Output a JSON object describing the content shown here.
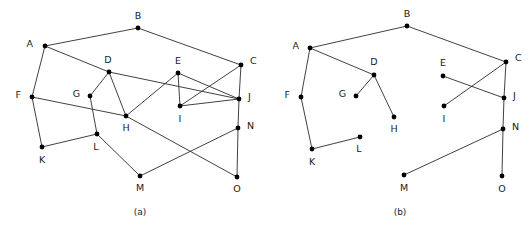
{
  "figure": {
    "background_color": "#ffffff",
    "edge_color": "#2b2b2b",
    "vertex_color": "#000000",
    "label_color": "#1a1a1a",
    "width": 531,
    "height": 235
  },
  "panels": [
    {
      "id": "panel-a",
      "caption": "(a)",
      "caption_pos": {
        "x": 140,
        "y": 215
      },
      "type": "graph",
      "vertices": [
        {
          "id": "A",
          "label": "A",
          "x": 45,
          "y": 46,
          "lx": 33,
          "ly": 44
        },
        {
          "id": "B",
          "label": "B",
          "x": 138,
          "y": 28,
          "lx": 138,
          "ly": 16
        },
        {
          "id": "C",
          "label": "C",
          "x": 241,
          "y": 65,
          "lx": 250,
          "ly": 61
        },
        {
          "id": "D",
          "label": "D",
          "x": 109,
          "y": 72,
          "lx": 108,
          "ly": 60
        },
        {
          "id": "E",
          "label": "E",
          "x": 178,
          "y": 73,
          "lx": 178,
          "ly": 61
        },
        {
          "id": "F",
          "label": "F",
          "x": 32,
          "y": 97,
          "lx": 21,
          "ly": 95
        },
        {
          "id": "G",
          "label": "G",
          "x": 90,
          "y": 96,
          "lx": 80,
          "ly": 94
        },
        {
          "id": "H",
          "label": "H",
          "x": 126,
          "y": 116,
          "lx": 126,
          "ly": 128
        },
        {
          "id": "I",
          "label": "I",
          "x": 180,
          "y": 106,
          "lx": 180,
          "ly": 119
        },
        {
          "id": "J",
          "label": "J",
          "x": 239,
          "y": 99,
          "lx": 248,
          "ly": 97
        },
        {
          "id": "K",
          "label": "K",
          "x": 42,
          "y": 147,
          "lx": 42,
          "ly": 160
        },
        {
          "id": "L",
          "label": "L",
          "x": 97,
          "y": 134,
          "lx": 96,
          "ly": 147
        },
        {
          "id": "M",
          "label": "M",
          "x": 140,
          "y": 176,
          "lx": 140,
          "ly": 188
        },
        {
          "id": "N",
          "label": "N",
          "x": 238,
          "y": 128,
          "lx": 247,
          "ly": 126
        },
        {
          "id": "O",
          "label": "O",
          "x": 237,
          "y": 177,
          "lx": 237,
          "ly": 189
        }
      ],
      "edges": [
        [
          "A",
          "B"
        ],
        [
          "B",
          "C"
        ],
        [
          "A",
          "D"
        ],
        [
          "A",
          "F"
        ],
        [
          "D",
          "G"
        ],
        [
          "D",
          "H"
        ],
        [
          "D",
          "J"
        ],
        [
          "G",
          "L"
        ],
        [
          "F",
          "H"
        ],
        [
          "F",
          "K"
        ],
        [
          "K",
          "L"
        ],
        [
          "L",
          "M"
        ],
        [
          "H",
          "E"
        ],
        [
          "H",
          "O"
        ],
        [
          "E",
          "I"
        ],
        [
          "E",
          "J"
        ],
        [
          "C",
          "I"
        ],
        [
          "C",
          "J"
        ],
        [
          "I",
          "J"
        ],
        [
          "J",
          "N"
        ],
        [
          "N",
          "O"
        ],
        [
          "M",
          "N"
        ]
      ]
    },
    {
      "id": "panel-b",
      "caption": "(b)",
      "caption_pos": {
        "x": 400,
        "y": 215
      },
      "type": "spanning-tree",
      "vertices": [
        {
          "id": "A",
          "label": "A",
          "x": 310,
          "y": 48,
          "lx": 299,
          "ly": 46
        },
        {
          "id": "B",
          "label": "B",
          "x": 407,
          "y": 26,
          "lx": 407,
          "ly": 14
        },
        {
          "id": "C",
          "label": "C",
          "x": 506,
          "y": 62,
          "lx": 515,
          "ly": 58
        },
        {
          "id": "D",
          "label": "D",
          "x": 374,
          "y": 75,
          "lx": 374,
          "ly": 62
        },
        {
          "id": "E",
          "label": "E",
          "x": 443,
          "y": 76,
          "lx": 443,
          "ly": 63
        },
        {
          "id": "F",
          "label": "F",
          "x": 301,
          "y": 97,
          "lx": 290,
          "ly": 95
        },
        {
          "id": "G",
          "label": "G",
          "x": 356,
          "y": 96,
          "lx": 346,
          "ly": 94
        },
        {
          "id": "H",
          "label": "H",
          "x": 394,
          "y": 117,
          "lx": 394,
          "ly": 129
        },
        {
          "id": "I",
          "label": "I",
          "x": 444,
          "y": 106,
          "lx": 444,
          "ly": 119
        },
        {
          "id": "J",
          "label": "J",
          "x": 504,
          "y": 98,
          "lx": 513,
          "ly": 96
        },
        {
          "id": "K",
          "label": "K",
          "x": 312,
          "y": 149,
          "lx": 312,
          "ly": 162
        },
        {
          "id": "L",
          "label": "L",
          "x": 360,
          "y": 137,
          "lx": 359,
          "ly": 149
        },
        {
          "id": "M",
          "label": "M",
          "x": 404,
          "y": 175,
          "lx": 404,
          "ly": 188
        },
        {
          "id": "N",
          "label": "N",
          "x": 503,
          "y": 129,
          "lx": 512,
          "ly": 127
        },
        {
          "id": "O",
          "label": "O",
          "x": 502,
          "y": 176,
          "lx": 502,
          "ly": 189
        }
      ],
      "edges": [
        [
          "A",
          "B"
        ],
        [
          "B",
          "C"
        ],
        [
          "A",
          "D"
        ],
        [
          "A",
          "F"
        ],
        [
          "D",
          "G"
        ],
        [
          "D",
          "H"
        ],
        [
          "F",
          "K"
        ],
        [
          "K",
          "L"
        ],
        [
          "C",
          "I"
        ],
        [
          "C",
          "J"
        ],
        [
          "E",
          "J"
        ],
        [
          "J",
          "N"
        ],
        [
          "N",
          "O"
        ],
        [
          "M",
          "N"
        ]
      ]
    }
  ]
}
